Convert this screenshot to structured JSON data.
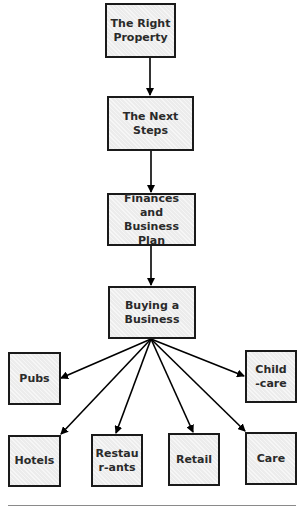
{
  "diagram": {
    "type": "flowchart",
    "colors": {
      "box_fill": "#ececec",
      "box_border": "#1a1a1a",
      "text": "#2a2a2a",
      "arrow": "#000000",
      "rule": "#8a8a8a"
    },
    "nodes": {
      "right_property": {
        "label": "The Right Property"
      },
      "next_steps": {
        "label": "The Next Steps"
      },
      "finances": {
        "label": "Finances and Business Plan"
      },
      "buying": {
        "label": "Buying a Business"
      },
      "pubs": {
        "label": "Pubs"
      },
      "childcare": {
        "label": "Child-care"
      },
      "hotels": {
        "label": "Hotels"
      },
      "restaurants": {
        "label": "Restaur-ants"
      },
      "retail": {
        "label": "Retail"
      },
      "care": {
        "label": "Care"
      }
    },
    "edges": [
      {
        "from": "The Right Property",
        "to": "The Next Steps"
      },
      {
        "from": "The Next Steps",
        "to": "Finances and Business Plan"
      },
      {
        "from": "Finances and Business Plan",
        "to": "Buying a Business"
      },
      {
        "from": "Buying a Business",
        "to": "Pubs"
      },
      {
        "from": "Buying a Business",
        "to": "Child-care"
      },
      {
        "from": "Buying a Business",
        "to": "Hotels"
      },
      {
        "from": "Buying a Business",
        "to": "Restaur-ants"
      },
      {
        "from": "Buying a Business",
        "to": "Retail"
      },
      {
        "from": "Buying a Business",
        "to": "Care"
      }
    ]
  }
}
